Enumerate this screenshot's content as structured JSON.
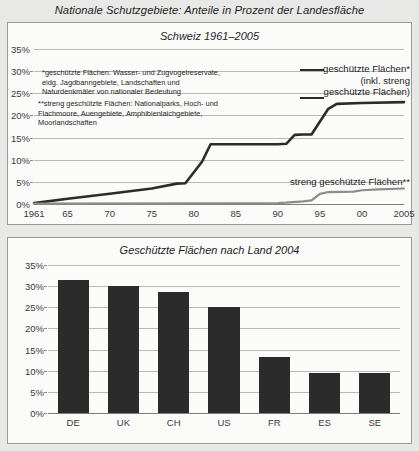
{
  "main_title": "Nationale Schutzgebiete: Anteile in Prozent der Landesfläche",
  "colors": {
    "page_background": "#e8e8e6",
    "panel_background": "#fbfbfa",
    "panel_border": "#9a9a96",
    "series_protected": "#2b2b2b",
    "series_strictly_protected": "#8c8c88",
    "bar": "#2b2b2b",
    "gridline": "#b9b9b5"
  },
  "top_panel": {
    "title": "Schweiz 1961–2005",
    "footnotes": [
      "*geschützte Flächen: Wasser- und Zugvogelreservate,\neidg. Jagdbanngebiete, Landschaften und\nNaturdenkmäler von nationaler Bedeutung",
      "**streng geschützte Flächen: Nationalparks, Hoch- und\nFlachmoore, Auengebiete, Amphibienlaichgebiete,\nMoorlandschaften"
    ],
    "legend_upper": "geschützte Flächen*\n(inkl. streng\ngeschützte Flächen)",
    "legend_lower": "streng geschützte Flächen**"
  },
  "bottom_panel": {
    "title": "Geschützte Flächen nach Land 2004"
  },
  "chart_data": [
    {
      "type": "line",
      "title": "Schweiz 1961–2005",
      "xlabel": "",
      "ylabel": "",
      "xlim": [
        1961,
        2005
      ],
      "ylim": [
        0,
        35
      ],
      "grid": true,
      "legend_position": "inside-right",
      "ytick_labels": [
        "0%",
        "5%",
        "10%",
        "15%",
        "20%",
        "25%",
        "30%",
        "35%"
      ],
      "ytick_values": [
        0,
        5,
        10,
        15,
        20,
        25,
        30,
        35
      ],
      "xtick_labels": [
        "1961",
        "65",
        "70",
        "75",
        "80",
        "85",
        "90",
        "95",
        "00",
        "2005"
      ],
      "xtick_values": [
        1961,
        1965,
        1970,
        1975,
        1980,
        1985,
        1990,
        1995,
        2000,
        2005
      ],
      "series": [
        {
          "name": "geschützte Flächen* (inkl. streng geschützte Flächen)",
          "color": "#2b2b2b",
          "x": [
            1961,
            1965,
            1970,
            1975,
            1978,
            1979,
            1981,
            1982,
            1990,
            1991,
            1992,
            1993,
            1994,
            1996,
            1997,
            2000,
            2005
          ],
          "values": [
            0.2,
            1.2,
            2.3,
            3.5,
            4.6,
            4.7,
            9.6,
            13.5,
            13.5,
            13.6,
            15.6,
            15.7,
            15.7,
            21.5,
            22.6,
            22.8,
            23.0
          ]
        },
        {
          "name": "streng geschützte Flächen**",
          "color": "#8c8c88",
          "x": [
            1961,
            1980,
            1990,
            1991,
            1993,
            1994,
            1995,
            1996,
            1999,
            2000,
            2002,
            2005
          ],
          "values": [
            0.1,
            0.15,
            0.2,
            0.3,
            0.6,
            0.8,
            2.3,
            2.7,
            2.8,
            3.1,
            3.3,
            3.5
          ]
        }
      ]
    },
    {
      "type": "bar",
      "title": "Geschützte Flächen nach Land 2004",
      "xlabel": "",
      "ylabel": "",
      "ylim": [
        0,
        35
      ],
      "grid": true,
      "categories": [
        "DE",
        "UK",
        "CH",
        "US",
        "FR",
        "ES",
        "SE"
      ],
      "values": [
        31.5,
        30.0,
        28.7,
        25.0,
        13.3,
        9.5,
        9.5
      ],
      "ytick_labels": [
        "0%",
        "5%",
        "10%",
        "15%",
        "20%",
        "25%",
        "30%",
        "35%"
      ],
      "ytick_values": [
        0,
        5,
        10,
        15,
        20,
        25,
        30,
        35
      ]
    }
  ]
}
